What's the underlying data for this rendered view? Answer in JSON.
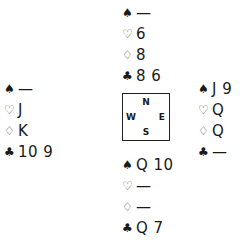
{
  "suits": {
    "spades": "♠",
    "hearts": "♡",
    "diamonds": "♢",
    "clubs": "♣"
  },
  "hands": {
    "north": {
      "spades": "—",
      "hearts": "6",
      "diamonds": "8",
      "clubs": "8 6"
    },
    "west": {
      "spades": "—",
      "hearts": "J",
      "diamonds": "K",
      "clubs": "10 9"
    },
    "east": {
      "spades": "J 9",
      "hearts": "Q",
      "diamonds": "Q",
      "clubs": "—"
    },
    "south": {
      "spades": "Q 10",
      "hearts": "—",
      "diamonds": "—",
      "clubs": "Q 7"
    }
  },
  "compass": {
    "n": "N",
    "s": "S",
    "e": "E",
    "w": "W"
  }
}
